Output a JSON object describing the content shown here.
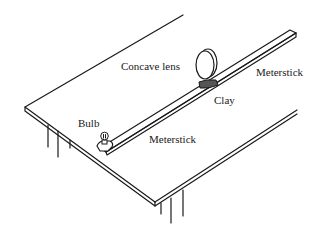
{
  "diagram": {
    "type": "optics-bench-setup",
    "labels": {
      "concave_lens": "Concave lens",
      "meterstick_right": "Meterstick",
      "clay": "Clay",
      "bulb": "Bulb",
      "meterstick_left": "Meterstick"
    },
    "components": [
      "table",
      "meterstick",
      "concave-lens",
      "clay",
      "bulb"
    ],
    "colors": {
      "line": "#1a1a1a",
      "clay": "#555555",
      "background": "#ffffff"
    }
  }
}
